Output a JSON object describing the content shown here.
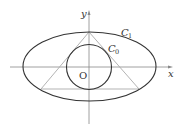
{
  "diagram": {
    "title": "",
    "axes": {
      "x_label": "x",
      "y_label": "y",
      "origin_label": "O"
    },
    "curves": {
      "ellipse": {
        "label": "C",
        "subscript": "1"
      },
      "circle": {
        "label": "C",
        "subscript": "0"
      }
    },
    "shapes": [
      "ellipse C1",
      "circle C0",
      "triangle inscribed in C1, circumscribed about C0"
    ],
    "colors": {
      "curve": "#333333",
      "axis": "#888888",
      "triangle": "#aaaaaa"
    }
  }
}
